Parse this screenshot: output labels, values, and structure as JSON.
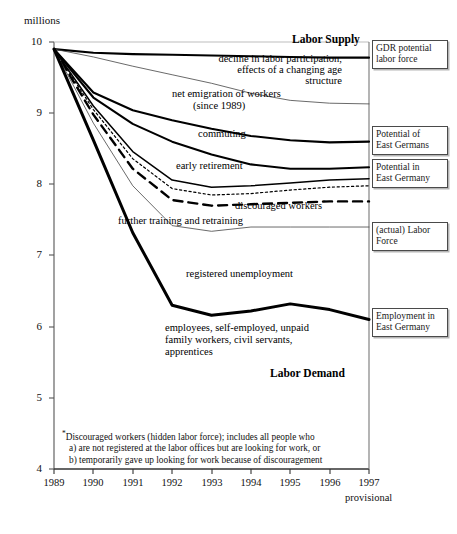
{
  "chart_data": {
    "type": "line",
    "title": "",
    "units_label": "millions",
    "xlabel": "",
    "ylabel": "millions",
    "x": [
      1989,
      1990,
      1991,
      1992,
      1993,
      1994,
      1995,
      1996,
      1997
    ],
    "xtick_labels": [
      "1989",
      "1990",
      "1991",
      "1992",
      "1993",
      "1994",
      "1995",
      "1996",
      "1997"
    ],
    "x_note": "provisional",
    "ytick_labels": [
      "10",
      "9",
      "8",
      "7",
      "6",
      "5",
      "4"
    ],
    "ylim": [
      4,
      10
    ],
    "xlim": [
      1989,
      1997
    ],
    "grid": false,
    "legend_position": "right-boxes",
    "series": [
      {
        "name": "GDR potential labor force",
        "style": "thick-solid",
        "values": [
          9.9,
          9.85,
          9.83,
          9.82,
          9.81,
          9.8,
          9.79,
          9.78,
          9.78
        ]
      },
      {
        "name": "decline in labor participation, effects of a changing age structure",
        "style": "thin-solid",
        "values": [
          9.9,
          9.79,
          9.66,
          9.54,
          9.42,
          9.28,
          9.18,
          9.14,
          9.13
        ]
      },
      {
        "name": "net emigration of workers (since 1989)",
        "style": "thick-solid",
        "values": [
          9.9,
          9.29,
          9.04,
          8.9,
          8.78,
          8.68,
          8.62,
          8.59,
          8.6
        ]
      },
      {
        "name": "commuting",
        "style": "thick-solid",
        "values": [
          9.9,
          9.22,
          8.85,
          8.6,
          8.42,
          8.28,
          8.22,
          8.22,
          8.24
        ]
      },
      {
        "name": "early retirement",
        "style": "thin-solid-2",
        "values": [
          9.9,
          9.1,
          8.46,
          8.06,
          7.96,
          7.98,
          8.02,
          8.06,
          8.08
        ]
      },
      {
        "name": "discouraged workers",
        "style": "dotted",
        "values": [
          9.9,
          9.05,
          8.36,
          7.94,
          7.85,
          7.87,
          7.92,
          7.96,
          7.98
        ]
      },
      {
        "name": "further training and retraining",
        "style": "dashed",
        "values": [
          9.9,
          8.98,
          8.22,
          7.78,
          7.7,
          7.72,
          7.74,
          7.76,
          7.76
        ]
      },
      {
        "name": "(actual) Labor Force",
        "style": "thin-solid",
        "values": [
          9.9,
          8.86,
          7.98,
          7.42,
          7.34,
          7.4,
          7.4,
          7.4,
          7.4
        ]
      },
      {
        "name": "registered unemployment / Employment in East Germany",
        "style": "very-thick-solid",
        "values": [
          9.9,
          8.62,
          7.32,
          6.3,
          6.16,
          6.22,
          6.32,
          6.24,
          6.1
        ]
      }
    ],
    "inline_annotations": [
      {
        "text": "Labor Supply",
        "bold": true
      },
      {
        "text": "decline in labor participation, effects of a changing age structure",
        "bold": false
      },
      {
        "text": "net emigration of workers (since 1989)",
        "bold": false
      },
      {
        "text": "commuting",
        "bold": false
      },
      {
        "text": "early retirement",
        "bold": false
      },
      {
        "text": "discouraged workers*",
        "bold": false
      },
      {
        "text": "further training and retraining",
        "bold": false
      },
      {
        "text": "registered unemployment",
        "bold": false
      },
      {
        "text": "employees, self-employed, unpaid family workers, civil servants, apprentices",
        "bold": false
      },
      {
        "text": "Labor Demand",
        "bold": true
      }
    ],
    "side_labels": [
      "GDR potential labor force",
      "Potential of East Germans",
      "Potential in East Germany",
      "(actual) Labor Force",
      "Employment in East Germany"
    ],
    "footnote": [
      "Discouraged workers (hidden labor force); includes all people who",
      "a) are not registered at the labor offices but are looking for work, or",
      "b) temporarily gave up looking for work because of discouragement"
    ]
  },
  "units": "millions",
  "yticks": [
    {
      "label": "10",
      "y": 42
    },
    {
      "label": "9",
      "y": 113
    },
    {
      "label": "8",
      "y": 184
    },
    {
      "label": "7",
      "y": 255
    },
    {
      "label": "6",
      "y": 327
    },
    {
      "label": "5",
      "y": 398
    },
    {
      "label": "4",
      "y": 469
    }
  ],
  "xticks": [
    {
      "label": "1989",
      "x": 54
    },
    {
      "label": "1990",
      "x": 93
    },
    {
      "label": "1991",
      "x": 133
    },
    {
      "label": "1992",
      "x": 172
    },
    {
      "label": "1993",
      "x": 212
    },
    {
      "label": "1994",
      "x": 251
    },
    {
      "label": "1995",
      "x": 290
    },
    {
      "label": "1996",
      "x": 330
    },
    {
      "label": "1997",
      "x": 369
    }
  ],
  "x_provisional": "provisional",
  "annotations": {
    "labor_supply": "Labor Supply",
    "decline_line1": "decline in labor participation,",
    "decline_line2": "effects of a changing age",
    "decline_line3": "structure",
    "net_emigration_line1": "net emigration of workers",
    "net_emigration_line2": "(since 1989)",
    "commuting": "commuting",
    "early_retirement": "early retirement",
    "discouraged_workers": "discouraged workers",
    "further_training": "further training and retraining",
    "registered_unemployment": "registered unemployment",
    "employees_line1": "employees, self-employed, unpaid",
    "employees_line2": "family workers, civil servants,",
    "employees_line3": "apprentices",
    "labor_demand": "Labor Demand"
  },
  "side_boxes": {
    "gdr_potential_line1": "GDR potential",
    "gdr_potential_line2": "labor force",
    "potential_of_line1": "Potential of",
    "potential_of_line2": "East Germans",
    "potential_in_line1": "Potential in",
    "potential_in_line2": "East Germany",
    "actual_labor_line1": "(actual) Labor",
    "actual_labor_line2": "Force",
    "employment_line1": "Employment in",
    "employment_line2": "East Germany"
  },
  "footnote": {
    "line1": "Discouraged workers (hidden labor force); includes all people who",
    "line2": "a) are not registered at the labor offices but are looking for work, or",
    "line3": "b) temporarily gave up looking for work because of discouragement"
  }
}
